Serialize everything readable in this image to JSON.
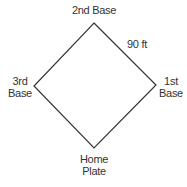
{
  "diagram": {
    "line_color": "#333333",
    "bases": {
      "second": {
        "label": "2nd Base"
      },
      "first": {
        "line1": "1st",
        "line2": "Base"
      },
      "third": {
        "line1": "3rd",
        "line2": "Base"
      },
      "home": {
        "line1": "Home",
        "line2": "Plate"
      }
    },
    "side_label": "90 ft"
  }
}
